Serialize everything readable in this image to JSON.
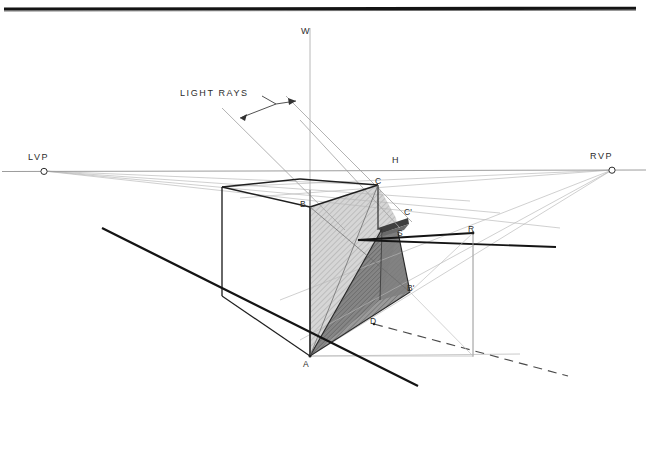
{
  "drawing": {
    "title": "Two-point perspective shadow construction",
    "background_color": "#ffffff",
    "border_color": "#1a1a1a",
    "labels": {
      "w": "W",
      "h": "H",
      "lvp": "LVP",
      "rvp": "RVP",
      "light_rays": "LIGHT RAYS",
      "a": "A",
      "b": "B",
      "c": "C",
      "c_prime": "C'",
      "b_prime": "B'",
      "d": "D",
      "r": "R",
      "s": "S"
    },
    "colors": {
      "heavy_line": "#1c1c1c",
      "medium_line": "#4a4a4a",
      "light_line": "#9a9a9a",
      "faint_line": "#b9b9b9",
      "hatch_face": "#cfcfcf",
      "shadow_face": "#8c8c8c",
      "shadow_dark": "#6f6f6f",
      "sliver_dark": "#3a3a3a",
      "text": "#2c2c2c"
    },
    "geometry": {
      "horizon_y": 170,
      "lvp_point": [
        44,
        171
      ],
      "rvp_point": [
        612,
        170
      ],
      "vertical_w_x": 310,
      "apex_a": [
        310,
        356
      ],
      "corner_b": [
        310,
        207
      ],
      "corner_c": [
        378,
        185
      ],
      "corner_c_prime": [
        408,
        216
      ],
      "corner_b_prime": [
        410,
        292
      ],
      "point_d": [
        374,
        324
      ],
      "point_r": [
        473,
        233
      ],
      "point_s": [
        400,
        235
      ],
      "box_left_x": 222,
      "box_top_y": 187,
      "box_bottom_left_y": 296
    },
    "annotations": {
      "light_ray_angle_deg": 45,
      "ray_count": 2
    }
  }
}
